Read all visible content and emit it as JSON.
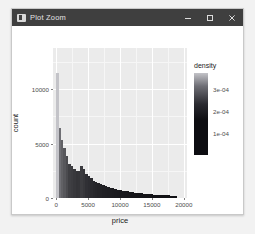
{
  "window": {
    "title": "Plot Zoom",
    "icon": "plot-window-icon",
    "controls": [
      {
        "name": "minimize",
        "glyph": "minimize-icon"
      },
      {
        "name": "maximize",
        "glyph": "maximize-icon"
      },
      {
        "name": "close",
        "glyph": "close-icon"
      }
    ]
  },
  "colors": {
    "titlebar_bg": "#3f3f3f",
    "titlebar_fg": "#e3e3e3",
    "panel_bg": "#ebebeb",
    "grid": "#ffffff",
    "bar_dark": "#16161a",
    "bar_light": "#8f8f96",
    "desktop_bg": "#f2f2f2",
    "window_bg": "#ffffff",
    "axis_text": "#4d4d4d",
    "axis_title": "#1a1a1a"
  },
  "chart_data": {
    "type": "bar",
    "title": "",
    "xlabel": "price",
    "ylabel": "count",
    "xlim": [
      -500,
      20500
    ],
    "ylim": [
      0,
      13800
    ],
    "grid": true,
    "legend": {
      "position": "right",
      "title": "density",
      "ticks": [
        "3e-04",
        "2e-04",
        "1e-04"
      ],
      "tick_values": [
        0.0003,
        0.0002,
        0.0001
      ],
      "range": [
        0.0,
        0.00037
      ],
      "gradient_low": "#0d0d11",
      "gradient_high": "#c3c3c8"
    },
    "xticks": [
      0,
      5000,
      10000,
      15000,
      20000
    ],
    "xtick_labels": [
      "0",
      "5000",
      "10000",
      "15000",
      "20000"
    ],
    "yticks": [
      0,
      5000,
      10000
    ],
    "ytick_labels": [
      "0",
      "5000",
      "10000"
    ],
    "bin_width": 380,
    "x": [
      190,
      570,
      950,
      1330,
      1710,
      2090,
      2470,
      2850,
      3230,
      3610,
      3990,
      4370,
      4750,
      5130,
      5510,
      5890,
      6270,
      6650,
      7030,
      7410,
      7790,
      8170,
      8550,
      8930,
      9310,
      9690,
      10070,
      10450,
      10830,
      11210,
      11590,
      11970,
      12350,
      12730,
      13110,
      13490,
      13870,
      14250,
      14630,
      15010,
      15390,
      15770,
      16150,
      16530,
      16910,
      17290,
      17670,
      18050,
      18430,
      18810
    ],
    "values": [
      11500,
      6400,
      5300,
      4600,
      3900,
      3150,
      2950,
      2700,
      2450,
      2500,
      2950,
      2650,
      2250,
      2050,
      1800,
      1600,
      1500,
      1400,
      1300,
      1200,
      1120,
      1040,
      960,
      900,
      840,
      780,
      720,
      680,
      640,
      600,
      560,
      530,
      500,
      470,
      450,
      420,
      400,
      380,
      360,
      340,
      320,
      305,
      290,
      275,
      260,
      250,
      240,
      230,
      220,
      210
    ],
    "densities": [
      0.00037,
      0.0002,
      0.00017,
      0.00015,
      0.000126,
      0.000102,
      9.5e-05,
      8.7e-05,
      7.9e-05,
      8.1e-05,
      9.5e-05,
      8.5e-05,
      7.2e-05,
      6.6e-05,
      5.8e-05,
      5.2e-05,
      4.8e-05,
      4.5e-05,
      4.2e-05,
      3.9e-05,
      3.6e-05,
      3.4e-05,
      3.1e-05,
      2.9e-05,
      2.7e-05,
      2.5e-05,
      2.3e-05,
      2.2e-05,
      2.1e-05,
      1.9e-05,
      1.8e-05,
      1.7e-05,
      1.6e-05,
      1.5e-05,
      1.45e-05,
      1.35e-05,
      1.29e-05,
      1.22e-05,
      1.16e-05,
      1.1e-05,
      1.03e-05,
      9.8e-06,
      9.3e-06,
      8.9e-06,
      8.4e-06,
      8.1e-06,
      7.7e-06,
      7.4e-06,
      7.1e-06,
      6.8e-06
    ]
  }
}
